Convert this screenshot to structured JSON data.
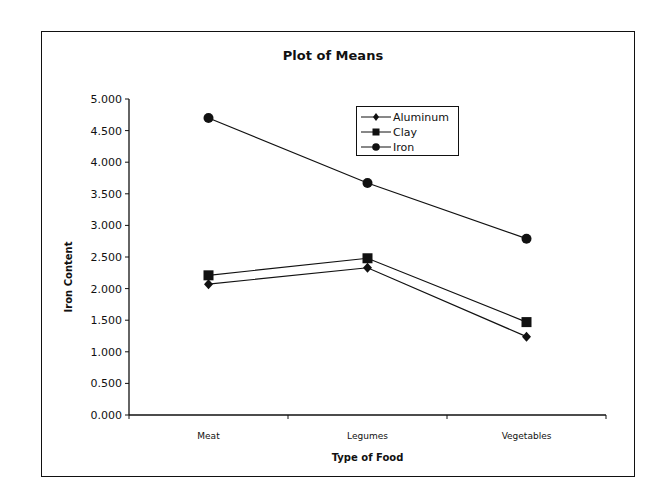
{
  "chart_data": {
    "type": "line",
    "title": "Plot of Means",
    "xlabel": "Type of Food",
    "ylabel": "Iron Content",
    "categories": [
      "Meat",
      "Legumes",
      "Vegetables"
    ],
    "series": [
      {
        "name": "Aluminum",
        "marker": "diamond",
        "values": [
          2.07,
          2.33,
          1.24
        ]
      },
      {
        "name": "Clay",
        "marker": "square",
        "values": [
          2.21,
          2.48,
          1.47
        ]
      },
      {
        "name": "Iron",
        "marker": "circle",
        "values": [
          4.7,
          3.67,
          2.79
        ]
      }
    ],
    "ylim": [
      0,
      5
    ],
    "yticks": [
      "0.000",
      "0.500",
      "1.000",
      "1.500",
      "2.000",
      "2.500",
      "3.000",
      "3.500",
      "4.000",
      "4.500",
      "5.000"
    ],
    "grid": false,
    "legend_position": "upper-center-right inside plot"
  },
  "legend": {
    "items": [
      "Aluminum",
      "Clay",
      "Iron"
    ]
  }
}
